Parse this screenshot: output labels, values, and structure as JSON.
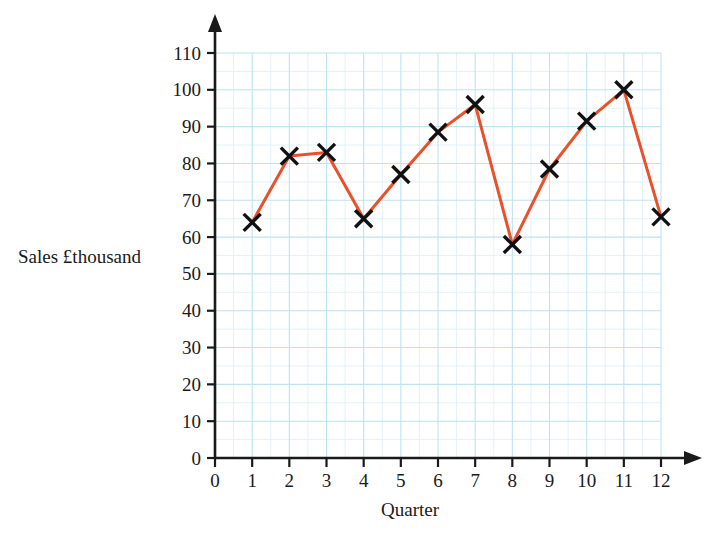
{
  "chart_data": {
    "type": "line",
    "title": "",
    "xlabel": "Quarter",
    "ylabel": "Sales £thousand",
    "x": [
      1,
      2,
      3,
      4,
      5,
      6,
      7,
      8,
      9,
      10,
      11,
      12
    ],
    "values": [
      64,
      82,
      83,
      65,
      77,
      88.5,
      96,
      58,
      78.5,
      91.5,
      100,
      65.5
    ],
    "series": [
      {
        "name": "Sales",
        "values": [
          64,
          82,
          83,
          65,
          77,
          88.5,
          96,
          58,
          78.5,
          91.5,
          100,
          65.5
        ]
      }
    ],
    "xlim": [
      0,
      12
    ],
    "ylim": [
      0,
      110
    ],
    "x_ticks": [
      "0",
      "1",
      "2",
      "3",
      "4",
      "5",
      "6",
      "7",
      "8",
      "9",
      "10",
      "11",
      "12"
    ],
    "y_ticks": [
      "0",
      "10",
      "20",
      "30",
      "40",
      "50",
      "60",
      "70",
      "80",
      "90",
      "100",
      "110"
    ],
    "y_tick_step": 10,
    "x_tick_step": 1,
    "grid": true,
    "grid_minor_step_y": 5,
    "grid_minor_step_x": 0.5,
    "legend": "none",
    "marker": "x-cross",
    "marker_color": "#111111",
    "line_color": "#e8512c",
    "grid_major_color": "#bde3f0",
    "grid_minor_color": "#dff0f7",
    "axis_color": "#1a1a1a",
    "background_color": "#ffffff"
  },
  "axes": {
    "y_label_text": "Sales £thousand",
    "x_label_text": "Quarter"
  }
}
